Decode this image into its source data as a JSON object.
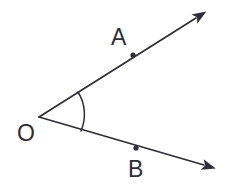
{
  "figure": {
    "kind": "geometry-diagram",
    "background_color": "#ffffff",
    "stroke_color": "#2e2e36",
    "label_color": "#2e2e36",
    "canvas": {
      "width": 229,
      "height": 194
    }
  },
  "labels": {
    "vertex": "O",
    "point_upper": "A",
    "point_lower": "B"
  },
  "label_positions": {
    "vertex": {
      "x": 17,
      "y": 141
    },
    "point_upper": {
      "x": 111,
      "y": 45
    },
    "point_lower": {
      "x": 128,
      "y": 177
    }
  },
  "geometry": {
    "vertex": {
      "x": 39,
      "y": 117
    },
    "ray_upper": {
      "name": "ray-OA",
      "from": {
        "x": 39,
        "y": 117
      },
      "to": {
        "x": 196,
        "y": 18
      },
      "arrow_tip": {
        "x": 202,
        "y": 14
      },
      "marked_point": {
        "x": 133,
        "y": 55
      },
      "marked_point_radius": 2.6
    },
    "ray_lower": {
      "name": "ray-OB",
      "from": {
        "x": 39,
        "y": 117
      },
      "to": {
        "x": 204,
        "y": 165
      },
      "arrow_tip": {
        "x": 211,
        "y": 168
      },
      "marked_point": {
        "x": 136,
        "y": 148
      },
      "marked_point_radius": 2.6
    },
    "angle_arc": {
      "name": "angle-arc-AOB",
      "start": {
        "x": 78,
        "y": 92
      },
      "end": {
        "x": 81,
        "y": 131
      },
      "radius": 42,
      "sweep": 1,
      "large_arc": 0
    },
    "stroke_width": 1.7
  }
}
